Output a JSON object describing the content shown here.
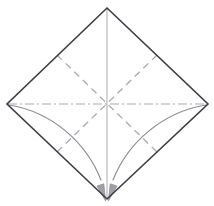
{
  "figure": {
    "kind": "origami-fold-diagram",
    "canvas": {
      "width": 214,
      "height": 206,
      "background": "#ffffff"
    }
  },
  "colors": {
    "paper_edge": "#3c3c44",
    "fold_line": "#a9a9b0",
    "center_line": "#b4b4ba",
    "arrow": "#8c8c93",
    "arrow_head_fill": "#a0a0a6",
    "background": "#ffffff"
  },
  "geometry": {
    "top_vertex": {
      "x": 107,
      "y": 8
    },
    "right_vertex": {
      "x": 208,
      "y": 104
    },
    "bottom_vertex": {
      "x": 107,
      "y": 199
    },
    "left_vertex": {
      "x": 7,
      "y": 104
    },
    "center": {
      "x": 107,
      "y": 104
    }
  },
  "shapes": {
    "paper_outline": {
      "label": "Square sheet rotated 45 degrees",
      "points": "107,8 208,104 107,199 7,104",
      "stroke": "#3c3c44",
      "stroke_width": 1.6,
      "fill": "none",
      "style": "solid"
    },
    "vertical_center_line": {
      "label": "Vertical center crease",
      "x1": 107,
      "y1": 9,
      "x2": 107,
      "y2": 198,
      "stroke": "#b4b4ba",
      "stroke_width": 1.1,
      "style": "solid"
    },
    "horizontal_center_line": {
      "label": "Horizontal center axis",
      "x1": 8,
      "y1": 104,
      "x2": 207,
      "y2": 104,
      "stroke": "#a9a9b0",
      "stroke_width": 1.1,
      "style": "dash-dot",
      "dash_array": "9 3 2 3"
    },
    "diagonal_fold_nw_se": {
      "label": "Valley fold from upper-left to lower-right",
      "x1": 57,
      "y1": 55,
      "x2": 157,
      "y2": 152,
      "stroke": "#a9a9b0",
      "stroke_width": 1.3,
      "style": "dashed",
      "dash_array": "7 5"
    },
    "diagonal_fold_ne_sw": {
      "label": "Valley fold from upper-right to lower-left",
      "x1": 157,
      "y1": 55,
      "x2": 57,
      "y2": 152,
      "stroke": "#a9a9b0",
      "stroke_width": 1.3,
      "style": "dashed",
      "dash_array": "7 5"
    },
    "arrow_left": {
      "label": "Curved arrow folding left corner down to bottom corner",
      "path": "M 9,105 C 52,112 86,142 101,180",
      "stroke": "#8c8c93",
      "stroke_width": 1.2,
      "head_at": {
        "x": 103,
        "y": 193
      },
      "head_angle_deg": 72
    },
    "arrow_right": {
      "label": "Curved arrow folding right corner down to bottom corner",
      "path": "M 206,105 C 163,112 128,142 113,180",
      "stroke": "#8c8c93",
      "stroke_width": 1.2,
      "head_at": {
        "x": 111,
        "y": 193
      },
      "head_angle_deg": 108
    }
  },
  "legend": {
    "dashed_meaning": "valley fold",
    "dash_dot_meaning": "center axis line",
    "solid_meaning": "paper edge",
    "arrow_meaning": "fold direction"
  }
}
